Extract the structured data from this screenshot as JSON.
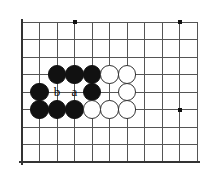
{
  "figure": {
    "kind": "go-board-diagram",
    "width": 215,
    "height": 187,
    "background_color": "#ffffff"
  },
  "board": {
    "origin_x": 22,
    "origin_y": 22,
    "spacing": 17.5,
    "cols": 11,
    "rows": 9,
    "line_color": "#555555",
    "line_width": 1,
    "edge_color": "#333333",
    "edge_width": 2.6,
    "edges": [
      "left",
      "bottom"
    ],
    "star_point_color": "#111111",
    "star_point_size": 4,
    "star_points": [
      {
        "col": 3,
        "row": 0
      },
      {
        "col": 9,
        "row": 0
      },
      {
        "col": 9,
        "row": 5
      }
    ]
  },
  "stones": {
    "radius": 9.2,
    "black_color": "#111111",
    "white_fill": "#ffffff",
    "white_outline": "#333333",
    "items": [
      {
        "color": "black",
        "col": 2,
        "row": 3
      },
      {
        "color": "black",
        "col": 3,
        "row": 3
      },
      {
        "color": "black",
        "col": 4,
        "row": 3
      },
      {
        "color": "white",
        "col": 5,
        "row": 3
      },
      {
        "color": "white",
        "col": 6,
        "row": 3
      },
      {
        "color": "black",
        "col": 1,
        "row": 4
      },
      {
        "color": "black",
        "col": 4,
        "row": 4
      },
      {
        "color": "white",
        "col": 6,
        "row": 4
      },
      {
        "color": "black",
        "col": 1,
        "row": 5
      },
      {
        "color": "black",
        "col": 2,
        "row": 5
      },
      {
        "color": "black",
        "col": 3,
        "row": 5
      },
      {
        "color": "white",
        "col": 4,
        "row": 5
      },
      {
        "color": "white",
        "col": 5,
        "row": 5
      },
      {
        "color": "white",
        "col": 6,
        "row": 5
      }
    ]
  },
  "labels": {
    "font_size": 13,
    "color": "#000000",
    "items": [
      {
        "text": "b",
        "col": 2,
        "row": 4
      },
      {
        "text": "a",
        "col": 3,
        "row": 4
      }
    ]
  }
}
